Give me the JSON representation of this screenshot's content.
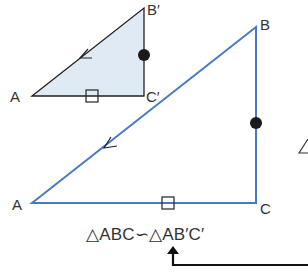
{
  "diagram": {
    "small_triangle": {
      "fill": "#dfeaf5",
      "stroke": "#222222",
      "vertices": {
        "A": [
          32,
          96
        ],
        "B_prime": [
          144,
          8
        ],
        "C_prime": [
          144,
          96
        ]
      },
      "labels": {
        "A": "A",
        "B_prime": "B′",
        "C_prime": "C′"
      },
      "marks": {
        "angle_arc_on_AB": "open arc",
        "dot_on_B_prime_C_prime": "filled dot",
        "square_on_AC_prime": "square"
      }
    },
    "large_triangle": {
      "stroke": "#4a78c8",
      "vertices": {
        "A": [
          32,
          203
        ],
        "B": [
          256,
          27
        ],
        "C": [
          256,
          203
        ]
      },
      "labels": {
        "A": "A",
        "B": "B",
        "C": "C"
      },
      "marks": {
        "angle_arc_on_AB": "open arc",
        "dot_on_BC": "filled dot",
        "square_on_AC": "square"
      }
    },
    "relation": {
      "text": "△ABC∽△AB′C′",
      "parts": [
        "△ABC",
        "∽",
        "△AB′C′"
      ]
    },
    "partial_symbol": "∠",
    "arrow": {
      "color": "#111111",
      "description": "arrow from right edge pointing up to similarity symbol"
    }
  }
}
